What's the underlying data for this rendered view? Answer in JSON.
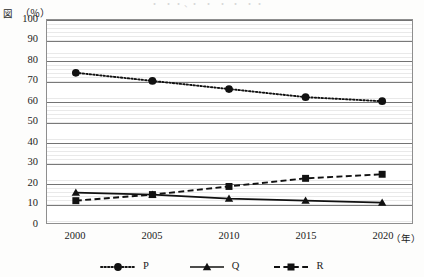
{
  "figure": {
    "corner_label": "図",
    "unit_label": "（％）",
    "top_cut_text": "・ ・・、・ ・ ・ ・ ・・"
  },
  "axes": {
    "x_unit": "（年）",
    "x_ticks": [
      "2000",
      "2005",
      "2010",
      "2015",
      "2020"
    ],
    "y_ticks": [
      "100",
      "90",
      "80",
      "70",
      "60",
      "50",
      "40",
      "30",
      "20",
      "10",
      "0"
    ]
  },
  "legend": {
    "items": [
      {
        "label": "P",
        "marker": "circle-marker",
        "line": "dotted"
      },
      {
        "label": "Q",
        "marker": "triangle-marker",
        "line": "solid"
      },
      {
        "label": "R",
        "marker": "square-marker",
        "line": "dashed"
      }
    ]
  },
  "chart_data": {
    "type": "line",
    "title": "",
    "xlabel": "（年）",
    "ylabel": "（％）",
    "x": [
      2000,
      2005,
      2010,
      2015,
      2020
    ],
    "categories": [
      "2000",
      "2005",
      "2010",
      "2015",
      "2020"
    ],
    "xlim": [
      1998,
      2022
    ],
    "ylim": [
      0,
      100
    ],
    "ytick_step": 10,
    "grid": true,
    "legend_position": "bottom",
    "series": [
      {
        "name": "P",
        "style": "dotted",
        "marker": "circle",
        "color": "#111111",
        "values": [
          74,
          70,
          66,
          62,
          60
        ]
      },
      {
        "name": "Q",
        "style": "solid",
        "marker": "triangle",
        "color": "#111111",
        "values": [
          15,
          14,
          12,
          11,
          10
        ]
      },
      {
        "name": "R",
        "style": "dashed",
        "marker": "square",
        "color": "#111111",
        "values": [
          11,
          14,
          18,
          22,
          24
        ]
      }
    ]
  }
}
